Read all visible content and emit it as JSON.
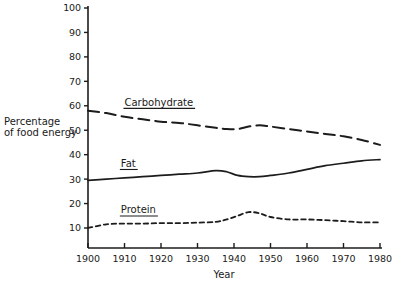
{
  "chart_data": {
    "type": "line",
    "title": "",
    "xlabel": "Year",
    "ylabel": "Percentage of food energy",
    "ylabel_line1": "Percentage",
    "ylabel_line2": "of food energy",
    "xlim": [
      1900,
      1980
    ],
    "ylim": [
      0,
      100
    ],
    "grid": false,
    "legend_position": "inline-labels",
    "xticks": [
      1900,
      1910,
      1920,
      1930,
      1940,
      1950,
      1960,
      1970,
      1980
    ],
    "xtick_labels": [
      "1900",
      "1910",
      "1920",
      "1930",
      "1940",
      "1950",
      "1960",
      "1970",
      "1980"
    ],
    "yticks": [
      10,
      20,
      30,
      40,
      50,
      60,
      70,
      80,
      90,
      100
    ],
    "ytick_labels": [
      "10",
      "20",
      "30",
      "40",
      "50",
      "60",
      "70",
      "80",
      "90",
      "100"
    ],
    "x": [
      1900,
      1905,
      1910,
      1915,
      1920,
      1925,
      1930,
      1935,
      1938,
      1941,
      1944,
      1947,
      1950,
      1955,
      1960,
      1965,
      1970,
      1975,
      1980
    ],
    "series": [
      {
        "name": "Carbohydrate",
        "label": "Carbohydrate",
        "style": "long-dash",
        "color": "#1c1c1c",
        "label_x": 1910,
        "label_y": 60,
        "values": [
          58,
          57,
          55.5,
          54.5,
          53.5,
          53,
          52,
          51,
          50.5,
          50.5,
          51.5,
          52,
          51.5,
          50.5,
          49.5,
          48.5,
          47.5,
          46,
          44
        ]
      },
      {
        "name": "Fat",
        "label": "Fat",
        "style": "solid",
        "color": "#1c1c1c",
        "label_x": 1909,
        "label_y": 35,
        "values": [
          29.5,
          30,
          30.5,
          31,
          31.5,
          32,
          32.5,
          33.5,
          33,
          31.5,
          31,
          31,
          31.5,
          32.5,
          34,
          35.5,
          36.5,
          37.5,
          38
        ]
      },
      {
        "name": "Protein",
        "label": "Protein",
        "style": "short-dash",
        "color": "#1c1c1c",
        "label_x": 1909,
        "label_y": 16,
        "values": [
          10,
          11.5,
          11.8,
          11.8,
          12,
          12,
          12.2,
          12.5,
          13.5,
          15,
          16.5,
          16,
          14.5,
          13.5,
          13.5,
          13.2,
          12.8,
          12.3,
          12.3
        ]
      }
    ]
  }
}
